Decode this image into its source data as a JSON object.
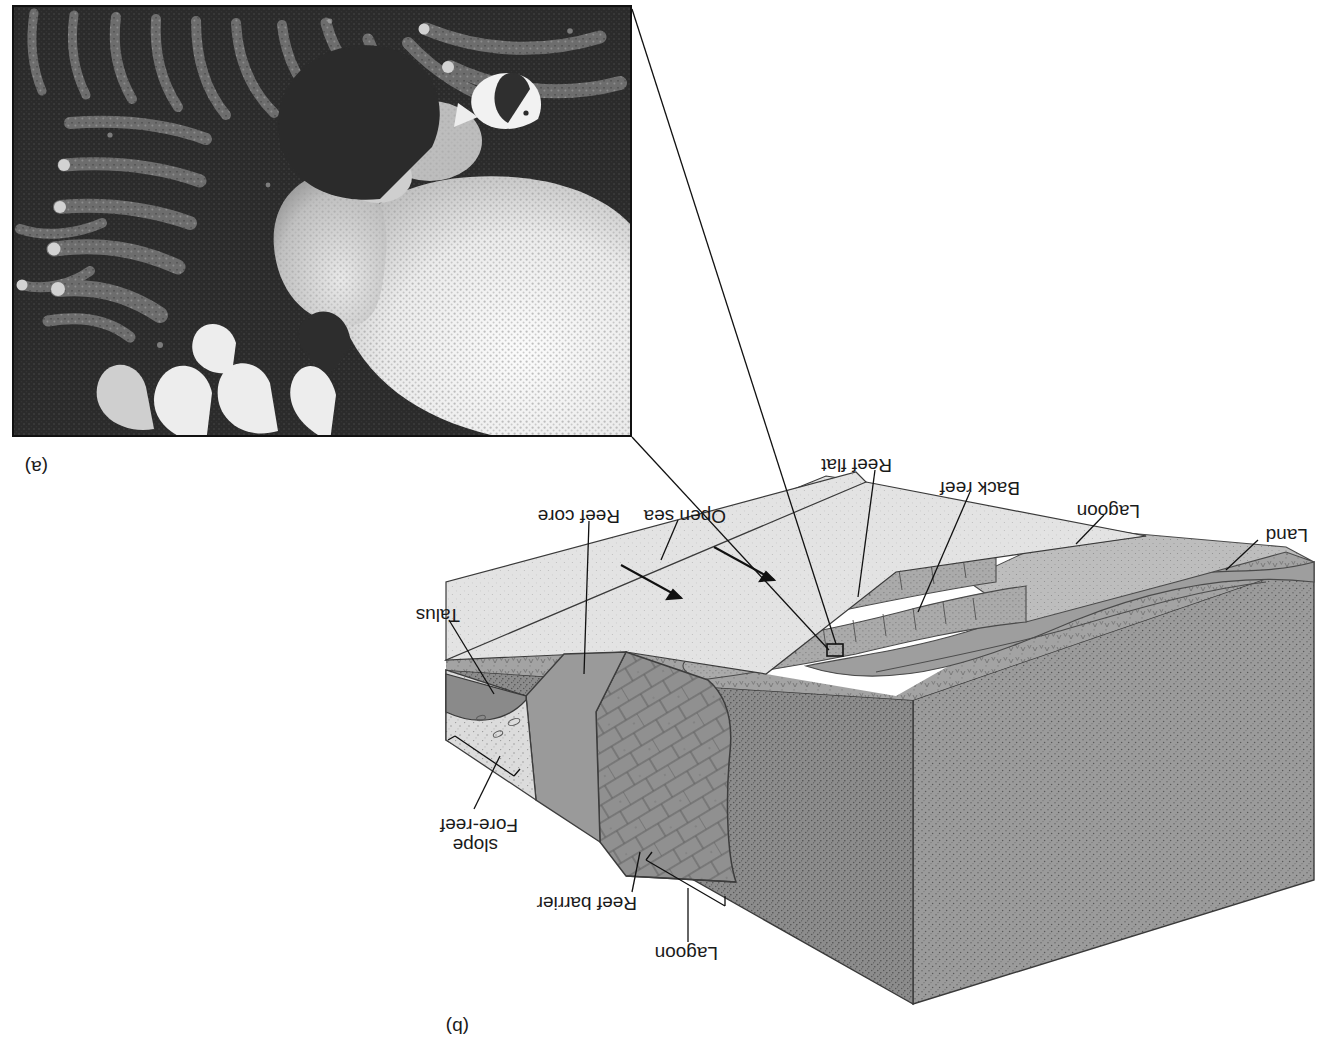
{
  "figure": {
    "panels": [
      {
        "tag": "(a)",
        "type": "photograph",
        "caption_text": "(a)"
      },
      {
        "tag": "(b)",
        "type": "block-diagram",
        "caption_text": "(b)"
      }
    ]
  },
  "panel_b": {
    "title_tag": "(b)",
    "labels": [
      {
        "id": "land",
        "text": "Land"
      },
      {
        "id": "lagoon-left",
        "text": "Lagoon"
      },
      {
        "id": "back-reef",
        "text": "Back reef"
      },
      {
        "id": "reef-flat",
        "text": "Reef flat"
      },
      {
        "id": "open-sea",
        "text": "Open sea"
      },
      {
        "id": "reef-core",
        "text": "Reef core"
      },
      {
        "id": "talus",
        "text": "Talus"
      },
      {
        "id": "lagoon-top",
        "text": "Lagoon"
      },
      {
        "id": "reef-barrier",
        "text": "Reef barrier"
      },
      {
        "id": "fore-reef-slope-line1",
        "text": "Fore-reef"
      },
      {
        "id": "fore-reef-slope-line2",
        "text": "slope"
      }
    ]
  },
  "panel_a": {
    "title_tag": "(a)",
    "subject": "underwater coral reef photograph"
  },
  "colors": {
    "ink": "#1a1a1a",
    "block_front_face": "#8e8e8e",
    "block_side_face": "#9a9a9a",
    "block_top_land": "#9d9d9d",
    "lagoon_surface": "#b9b9b9",
    "reef_flat": "#a9a9a9",
    "open_sea": "#e2e2e2",
    "reef_core_fill": "#8a8a8a",
    "talus_fill": "#8a8a8a",
    "fore_reef_light": "#d9d9d9",
    "photo_dark": "#2b2b2b",
    "paper": "#ffffff"
  }
}
